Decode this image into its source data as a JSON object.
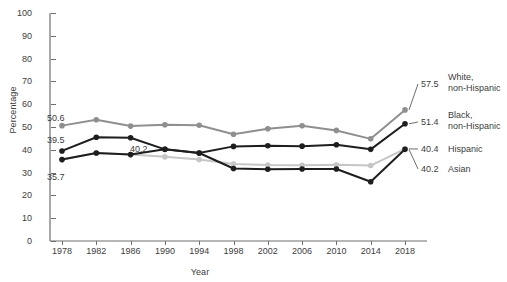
{
  "chart_data": {
    "type": "line",
    "title": "",
    "xlabel": "Year",
    "ylabel": "Percentage",
    "grid": false,
    "legend_position": "right-end-labels",
    "ylim": [
      0,
      100
    ],
    "yticks": [
      0,
      10,
      20,
      30,
      40,
      50,
      60,
      70,
      80,
      90,
      100
    ],
    "categories": [
      1978,
      1982,
      1986,
      1990,
      1994,
      1998,
      2002,
      2006,
      2010,
      2014,
      2018
    ],
    "series": [
      {
        "name": "White, non-Hispanic",
        "color": "#8f8f8f",
        "values": [
          50.6,
          53.2,
          50.4,
          51.0,
          50.8,
          46.8,
          49.2,
          50.5,
          48.5,
          44.8,
          57.5
        ],
        "start_label": "50.6",
        "end_label": "57.5"
      },
      {
        "name": "Black, non-Hispanic",
        "color": "#1e1e1e",
        "values": [
          39.5,
          45.5,
          45.3,
          40.2,
          38.6,
          41.5,
          41.8,
          41.6,
          42.2,
          40.2,
          51.4
        ],
        "start_label": "39.5",
        "end_label": "51.4"
      },
      {
        "name": "Hispanic",
        "color": "#c6c6c6",
        "values": [
          35.7,
          38.6,
          37.9,
          36.9,
          35.7,
          33.8,
          33.3,
          33.2,
          33.4,
          33.1,
          40.4
        ],
        "start_label": "35.7",
        "end_label": "40.4"
      },
      {
        "name": "Asian",
        "color": "#1e1e1e",
        "values": [
          35.7,
          38.6,
          37.9,
          40.2,
          38.6,
          31.8,
          31.5,
          31.6,
          31.6,
          26.0,
          40.2
        ],
        "start_label": "35.7",
        "end_label": "40.2"
      }
    ],
    "annotations": [
      {
        "text": "50.6",
        "series": "White, non-Hispanic",
        "at": 1978
      },
      {
        "text": "39.5",
        "series": "Black, non-Hispanic",
        "at": 1978
      },
      {
        "text": "35.7",
        "series": "Hispanic",
        "at": 1978
      },
      {
        "text": "40.2",
        "series": "Black, non-Hispanic",
        "at": 1990
      }
    ],
    "end_labels": [
      {
        "value": "57.5",
        "name_line1": "White,",
        "name_line2": "non-Hispanic"
      },
      {
        "value": "51.4",
        "name_line1": "Black,",
        "name_line2": "non-Hispanic"
      },
      {
        "value": "40.4",
        "name_line1": "Hispanic",
        "name_line2": ""
      },
      {
        "value": "40.2",
        "name_line1": "Asian",
        "name_line2": ""
      }
    ]
  }
}
